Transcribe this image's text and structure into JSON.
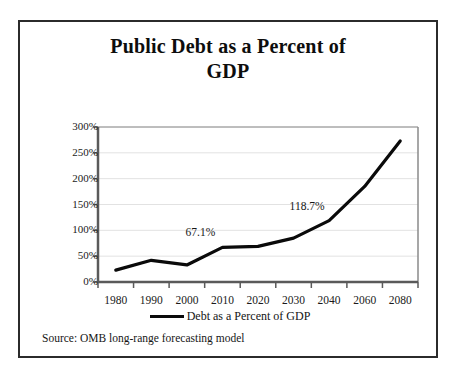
{
  "figure": {
    "border_color": "#2b2b2b",
    "background": "#ffffff"
  },
  "title": "Public Debt as a Percent of GDP",
  "title_line_1": "Public Debt as a Percent of",
  "title_line_2": "GDP",
  "source_note": "Source: OMB long-range forecasting model",
  "legend": {
    "entries": [
      {
        "label": "Debt as a Percent of GDP",
        "color": "#0a0a0a"
      }
    ],
    "position": "bottom-center"
  },
  "chart_data": {
    "type": "line",
    "title": "Public Debt as a Percent of GDP",
    "xlabel": "",
    "ylabel": "",
    "categories": [
      "1980",
      "1990",
      "2000",
      "2010",
      "2020",
      "2030",
      "2040",
      "2060",
      "2080"
    ],
    "series": [
      {
        "name": "Debt as a Percent of GDP",
        "color": "#0a0a0a",
        "values": [
          23,
          42,
          33,
          67.1,
          69,
          85,
          118.7,
          185,
          273
        ]
      }
    ],
    "y_tick_labels": [
      "0%",
      "50%",
      "100%",
      "150%",
      "200%",
      "250%",
      "300%"
    ],
    "y_tick_values": [
      0,
      50,
      100,
      150,
      200,
      250,
      300
    ],
    "ylim": [
      0,
      300
    ],
    "grid": "horizontal",
    "grid_color": "#e2e2e2",
    "axis_color": "#555555",
    "annotations": [
      {
        "text": "67.1%",
        "category": "2010",
        "value": 67.1
      },
      {
        "text": "118.7%",
        "category": "2040",
        "value": 118.7
      }
    ]
  }
}
